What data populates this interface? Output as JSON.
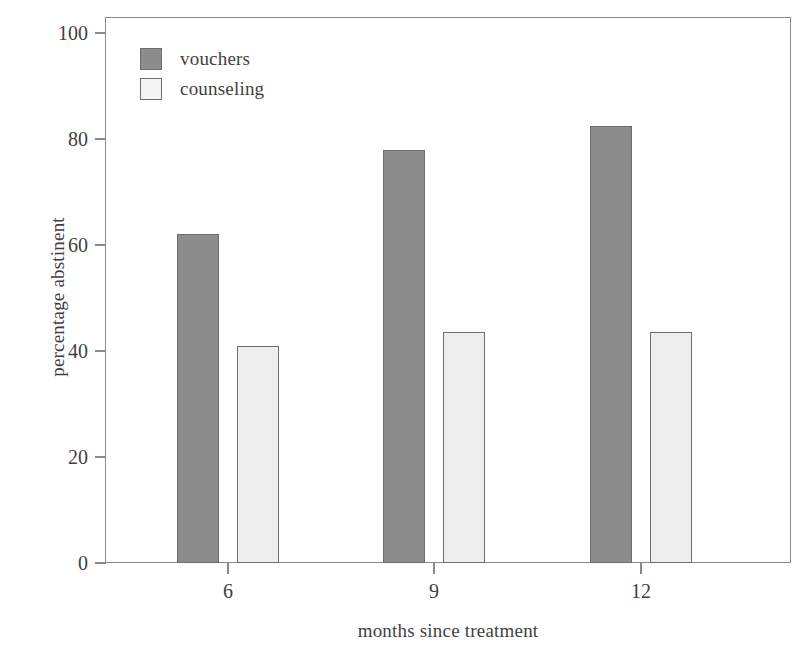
{
  "chart_data": {
    "type": "bar",
    "title": "",
    "subtitle": "",
    "xlabel": "months since treatment",
    "ylabel": "percentage abstinent",
    "categories": [
      "6",
      "9",
      "12"
    ],
    "series": [
      {
        "name": "vouchers",
        "values": [
          62,
          78,
          82.5
        ],
        "color": "#8c8c8c"
      },
      {
        "name": "counseling",
        "values": [
          41,
          43.5,
          43.5
        ],
        "color": "#eeeeee"
      }
    ],
    "ylim": [
      0,
      103
    ],
    "yticks": [
      0,
      20,
      40,
      60,
      80,
      100
    ],
    "ytick_labels": [
      "0",
      "20",
      "40",
      "60",
      "80",
      "100"
    ],
    "xtick_labels": [
      "6",
      "9",
      "12"
    ],
    "grid": false,
    "legend_position": "upper-left",
    "frame": true
  },
  "legend": {
    "entries": [
      {
        "label": "vouchers",
        "swatch": "dark-gray-square"
      },
      {
        "label": "counseling",
        "swatch": "light-gray-square"
      }
    ]
  },
  "axes": {
    "x_title": "months since treatment",
    "y_title": "percentage abstinent"
  },
  "colors": {
    "vouchers": "#8c8c8c",
    "counseling": "#eeeeee",
    "frame": "#8a8a8a",
    "text": "#3f3f3f",
    "background": "#ffffff"
  }
}
